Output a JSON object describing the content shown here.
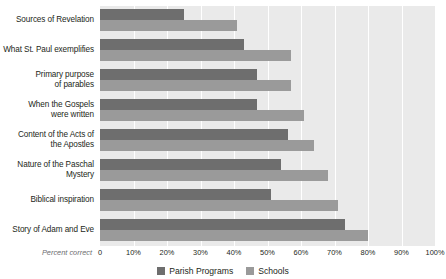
{
  "chart_data": {
    "type": "bar",
    "orientation": "horizontal",
    "title": "",
    "subtitle": "",
    "xlabel": "Percent correct",
    "ylabel": "",
    "xlim": [
      0,
      100
    ],
    "grid": true,
    "legend_position": "bottom",
    "categories": [
      "Sources of Revelation",
      "What St. Paul exemplifies",
      "Primary purpose of parables",
      "When the Gospels were written",
      "Content of the Acts of the Apostles",
      "Nature of the Paschal Mystery",
      "Biblical inspiration",
      "Story of Adam and Eve"
    ],
    "category_lines": [
      [
        "Sources of Revelation"
      ],
      [
        "What St. Paul exemplifies"
      ],
      [
        "Primary purpose",
        "of parables"
      ],
      [
        "When the Gospels",
        "were written"
      ],
      [
        "Content of the Acts of",
        "the Apostles"
      ],
      [
        "Nature of the Paschal",
        "Mystery"
      ],
      [
        "Biblical inspiration"
      ],
      [
        "Story of Adam and Eve"
      ]
    ],
    "series": [
      {
        "name": "Parish Programs",
        "color": "#6e6e6e",
        "values": [
          25,
          43,
          47,
          47,
          56,
          54,
          51,
          73
        ]
      },
      {
        "name": "Schools",
        "color": "#9a9a9a",
        "values": [
          41,
          57,
          57,
          61,
          64,
          68,
          71,
          80
        ]
      }
    ],
    "xticks": [
      0,
      10,
      20,
      30,
      40,
      50,
      60,
      70,
      80,
      90,
      100
    ],
    "xtick_labels": [
      "0",
      "10%",
      "20%",
      "30%",
      "40%",
      "50%",
      "60%",
      "70%",
      "80%",
      "90%",
      "100%"
    ],
    "plot_background": "#eaeaea",
    "gridline_color": "#ffffff"
  }
}
